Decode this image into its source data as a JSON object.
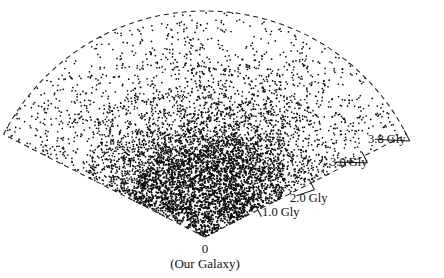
{
  "figure": {
    "type": "wedge-redshift-survey",
    "background_color": "#ffffff",
    "ink_color": "#0d0d0d",
    "origin_label": "0",
    "origin_sublabel": "(Our Galaxy)"
  },
  "labels": {
    "d1": "1.0 Gly",
    "d2": "2.0 Gly",
    "d3": "3.0 Gly",
    "d4": "3.8 Gly"
  },
  "chart_data": {
    "type": "scatter",
    "title": "",
    "subtitle": "",
    "xlabel": "",
    "ylabel": "",
    "projection": "polar-wedge",
    "grid": false,
    "legend": null,
    "annotations": [
      {
        "text": "0",
        "role": "origin-distance"
      },
      {
        "text": "(Our Galaxy)",
        "role": "origin-name"
      },
      {
        "text": "1.0 Gly",
        "role": "distance-tick"
      },
      {
        "text": "2.0 Gly",
        "role": "distance-tick"
      },
      {
        "text": "3.0 Gly",
        "role": "distance-tick"
      },
      {
        "text": "3.8 Gly",
        "role": "distance-tick"
      }
    ],
    "radial_axis": {
      "unit": "Gly",
      "min": 0,
      "max": 3.8,
      "tick_values": [
        0,
        1.0,
        2.0,
        3.0,
        3.8
      ],
      "tick_labels": [
        "0",
        "1.0 Gly",
        "2.0 Gly",
        "3.0 Gly",
        "3.8 Gly"
      ]
    },
    "angular_axis": {
      "unit": "degrees",
      "half_opening_angle": 63,
      "span": 126,
      "center_direction": "up"
    },
    "apex": {
      "x": 205,
      "y": 237
    },
    "max_radius_px": 226,
    "point_count": 6200,
    "point_radius_px": 0.85,
    "density_profile": {
      "description": "Galaxy surface density falls off strongly with distance from apex; strong filamentary clustering within ~1.6 Gly",
      "radial_bins_gly": [
        0.2,
        0.6,
        1.0,
        1.4,
        1.8,
        2.2,
        2.6,
        3.0,
        3.4,
        3.8
      ],
      "relative_density": [
        1.0,
        0.98,
        0.92,
        0.72,
        0.5,
        0.34,
        0.24,
        0.17,
        0.12,
        0.08
      ]
    },
    "clusters": [
      {
        "label": "core-filament-a",
        "r_gly": 0.55,
        "theta_deg": -6,
        "weight": 1.0
      },
      {
        "label": "core-filament-b",
        "r_gly": 0.75,
        "theta_deg": -26,
        "weight": 0.95
      },
      {
        "label": "core-filament-c",
        "r_gly": 0.62,
        "theta_deg": 14,
        "weight": 0.9
      },
      {
        "label": "great-wall",
        "r_gly": 1.15,
        "theta_deg": -2,
        "weight": 0.85
      },
      {
        "label": "wall-extension-left",
        "r_gly": 1.25,
        "theta_deg": -34,
        "weight": 0.7
      },
      {
        "label": "wall-extension-right",
        "r_gly": 1.2,
        "theta_deg": 26,
        "weight": 0.72
      },
      {
        "label": "finger-of-god",
        "r_gly": 1.55,
        "theta_deg": 36,
        "weight": 0.6
      },
      {
        "label": "outer-clump-left",
        "r_gly": 1.75,
        "theta_deg": -46,
        "weight": 0.45
      },
      {
        "label": "outer-clump-mid",
        "r_gly": 2.0,
        "theta_deg": 8,
        "weight": 0.42
      },
      {
        "label": "outer-clump-right",
        "r_gly": 2.3,
        "theta_deg": 30,
        "weight": 0.35
      },
      {
        "label": "sparse-halo",
        "r_gly": 2.9,
        "theta_deg": -12,
        "weight": 0.2
      }
    ],
    "voids": [
      {
        "label": "void-left",
        "r_gly": 1.45,
        "theta_deg": -18,
        "radius_gly": 0.22
      },
      {
        "label": "void-center",
        "r_gly": 1.7,
        "theta_deg": 4,
        "radius_gly": 0.26
      },
      {
        "label": "void-right",
        "r_gly": 1.35,
        "theta_deg": 44,
        "radius_gly": 0.2
      },
      {
        "label": "void-upper",
        "r_gly": 2.35,
        "theta_deg": -32,
        "radius_gly": 0.3
      }
    ]
  },
  "geometry": {
    "ticks": [
      {
        "key": "d1",
        "r_gly": 1.0,
        "label_x": 262,
        "label_y": 216
      },
      {
        "key": "d2",
        "r_gly": 2.0,
        "label_x": 290,
        "label_y": 202
      },
      {
        "key": "d3",
        "r_gly": 3.0,
        "label_x": 330,
        "label_y": 166
      },
      {
        "key": "d4",
        "r_gly": 3.8,
        "label_x": 368,
        "label_y": 143
      }
    ]
  }
}
